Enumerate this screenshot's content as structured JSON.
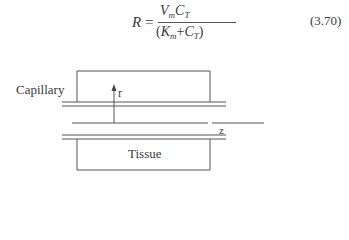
{
  "equation": {
    "lhs": "R",
    "equals": "=",
    "numerator": {
      "v": "V",
      "v_sub": "m",
      "c": "C",
      "c_sub": "T"
    },
    "denominator": {
      "open": "(",
      "k": "K",
      "k_sub": "m",
      "plus": "+",
      "c": "C",
      "c_sub": "T",
      "close": ")"
    },
    "number": "(3.70)"
  },
  "diagram": {
    "capillary_label": "Capillary",
    "tissue_label": "Tissue",
    "r_axis_label": "r",
    "z_axis_label": "z",
    "line_color": "#555555"
  }
}
